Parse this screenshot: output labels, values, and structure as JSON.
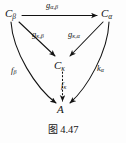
{
  "figure": {
    "caption_label": "图",
    "caption_number": "4.47",
    "nodes": [
      {
        "id": "c-beta",
        "base": "C",
        "sub": "β",
        "text": "Cβ"
      },
      {
        "id": "c-alpha",
        "base": "C",
        "sub": "α",
        "text": "Cα"
      },
      {
        "id": "c-kappa",
        "base": "C",
        "sub": "κ",
        "text": "Cκ"
      },
      {
        "id": "a",
        "base": "A",
        "sub": "",
        "text": "A"
      }
    ],
    "edges": [
      {
        "id": "g-alpha-beta",
        "base": "g",
        "sub": "α,β",
        "from": "c-beta",
        "to": "c-alpha",
        "style": "solid"
      },
      {
        "id": "g-kappa-beta",
        "base": "g",
        "sub": "κ,β",
        "from": "c-beta",
        "to": "c-kappa",
        "style": "solid"
      },
      {
        "id": "g-kappa-alpha",
        "base": "g",
        "sub": "κ,α",
        "from": "c-alpha",
        "to": "c-kappa",
        "style": "solid"
      },
      {
        "id": "f-beta",
        "base": "f",
        "sub": "β",
        "from": "c-beta",
        "to": "a",
        "style": "solid-curved"
      },
      {
        "id": "k-alpha",
        "base": "k",
        "sub": "α",
        "from": "c-alpha",
        "to": "a",
        "style": "solid-curved"
      },
      {
        "id": "f-kappa",
        "base": "f",
        "sub": "κ",
        "from": "c-kappa",
        "to": "a",
        "style": "dotted"
      }
    ],
    "colors": {
      "ink": "#121212",
      "background": "#fdfdfd"
    }
  }
}
